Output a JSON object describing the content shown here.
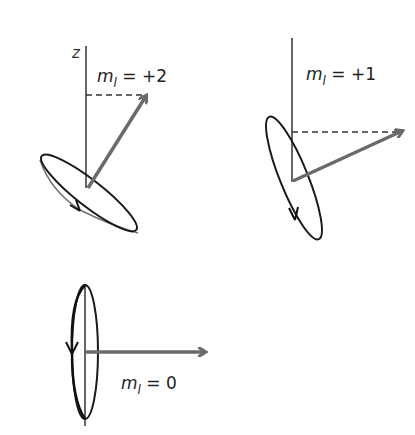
{
  "diagram": {
    "type": "vector-model orbital angular momentum precession",
    "axis_label": "z",
    "colors": {
      "vector": "#6a6a6a",
      "axis": "#333333",
      "ellipse": "#1a1a1a",
      "dashed": "#333333",
      "background": "#ffffff"
    },
    "panels": [
      {
        "id": "ml-plus-2",
        "m_symbol": "m",
        "m_sub": "l",
        "equals": "=",
        "value": "+2",
        "label_full": "m_l = +2"
      },
      {
        "id": "ml-plus-1",
        "m_symbol": "m",
        "m_sub": "l",
        "equals": "=",
        "value": "+1",
        "label_full": "m_l = +1"
      },
      {
        "id": "ml-0",
        "m_symbol": "m",
        "m_sub": "l",
        "equals": "=",
        "value": "0",
        "label_full": "m_l = 0"
      }
    ]
  }
}
